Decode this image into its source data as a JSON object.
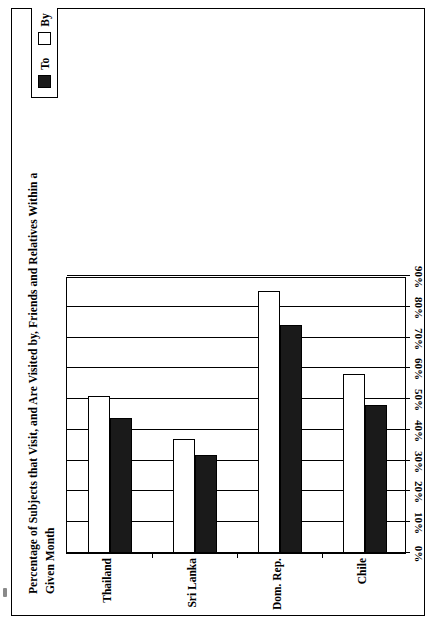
{
  "chart_data": {
    "type": "bar",
    "orientation": "vertical-rotated",
    "title": "Percentage of Subjects that Visit, and Are Visited by, Friends and Relatives Within a Given Month",
    "xlabel": "",
    "ylabel": "% of Subjects",
    "categories": [
      "Chile",
      "Dom. Rep.",
      "Sri Lanka",
      "Thailand"
    ],
    "series": [
      {
        "name": "To",
        "values": [
          48,
          74,
          32,
          44
        ]
      },
      {
        "name": "By",
        "values": [
          58,
          85,
          37,
          51
        ]
      }
    ],
    "ylim": [
      0,
      90
    ],
    "ytick_values": [
      0,
      10,
      20,
      30,
      40,
      50,
      60,
      70,
      80,
      90
    ],
    "ytick_labels": [
      "0%",
      "10%",
      "20%",
      "30%",
      "40%",
      "50%",
      "60%",
      "70%",
      "80%",
      "90%"
    ],
    "grid": true,
    "legend_position": "top",
    "legend": [
      {
        "label": "To",
        "color": "#1a1a1a",
        "swatch": "filled-square"
      },
      {
        "label": "By",
        "color": "#ffffff",
        "swatch": "empty-square"
      }
    ]
  },
  "colors": {
    "series_to": "#1a1a1a",
    "series_by": "#ffffff",
    "axis": "#000000",
    "background": "#ffffff"
  }
}
